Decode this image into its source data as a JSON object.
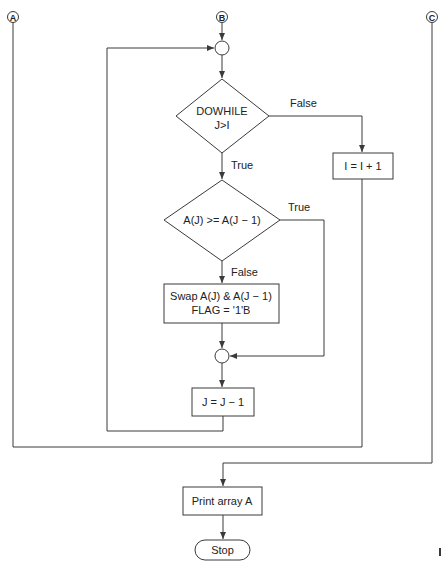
{
  "connectors": {
    "a": "A",
    "b": "B",
    "c": "C"
  },
  "decisions": {
    "dowhile": {
      "line1": "DOWHILE",
      "line2": "J>I"
    },
    "compare": {
      "label": "A(J) >= A(J − 1)"
    }
  },
  "processes": {
    "increment_i": "I = I + 1",
    "swap": {
      "line1": "Swap A(J) & A(J − 1)",
      "line2": "FLAG = '1'B"
    },
    "decrement_j": "J = J − 1",
    "print": "Print array A"
  },
  "terminator": {
    "stop": "Stop"
  },
  "edge_labels": {
    "dowhile_false": "False",
    "dowhile_true": "True",
    "compare_true": "True",
    "compare_false": "False"
  },
  "colors": {
    "line": "#3a3a3a",
    "text": "#222222",
    "background": "#ffffff"
  }
}
